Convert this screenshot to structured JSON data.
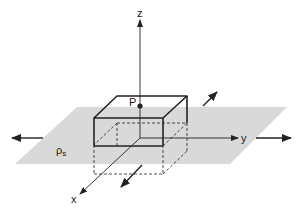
{
  "diagram": {
    "type": "3d-coordinate-figure",
    "colors": {
      "plane": "#d9d9d9",
      "line": "#222222",
      "background": "#ffffff"
    },
    "axes": {
      "z": "z",
      "y": "y",
      "x": "x"
    },
    "point_label": "P",
    "surface_charge_label": "ρ",
    "surface_charge_subscript": "s",
    "elements": [
      "infinite sheet of surface charge in xy-plane",
      "pillbox (Gaussian surface) centered on plane",
      "point P on top face on z-axis",
      "four arrows indicating plane extends to infinity"
    ]
  }
}
